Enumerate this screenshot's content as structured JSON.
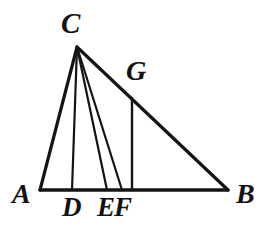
{
  "figure": {
    "stroke_color": "#141414",
    "background_color": "#ffffff",
    "label_color": "#121212"
  },
  "labels": {
    "A": "A",
    "B": "B",
    "C": "C",
    "D": "D",
    "E": "E",
    "F": "F",
    "G": "G"
  },
  "chart_data": {
    "type": "diagram",
    "points": [
      {
        "name": "A",
        "x": 40,
        "y": 190,
        "label_x": 12,
        "label_y": 180
      },
      {
        "name": "B",
        "x": 228,
        "y": 190,
        "label_x": 236,
        "label_y": 180
      },
      {
        "name": "C",
        "x": 77,
        "y": 47,
        "label_x": 61,
        "label_y": 9
      },
      {
        "name": "D",
        "x": 72,
        "y": 190,
        "label_x": 62,
        "label_y": 194
      },
      {
        "name": "E",
        "x": 107,
        "y": 190,
        "label_x": 97,
        "label_y": 194
      },
      {
        "name": "F",
        "x": 122,
        "y": 190,
        "label_x": 114,
        "label_y": 194
      },
      {
        "name": "G",
        "x": 132,
        "y": 100,
        "label_x": 126,
        "label_y": 57
      }
    ],
    "segments": [
      {
        "name": "AB",
        "from": "A",
        "to": "B",
        "kind": "triangle-side"
      },
      {
        "name": "AC",
        "from": "A",
        "to": "C",
        "kind": "triangle-side"
      },
      {
        "name": "CB",
        "from": "C",
        "to": "B",
        "kind": "triangle-side"
      },
      {
        "name": "CD",
        "from": "C",
        "to": "D",
        "kind": "cevian-vertical"
      },
      {
        "name": "CE",
        "from": "C",
        "to": "E",
        "kind": "cevian"
      },
      {
        "name": "CF",
        "from": "C",
        "to": "F",
        "kind": "cevian"
      },
      {
        "name": "GF",
        "from": "G",
        "to": "F",
        "kind": "vertical"
      }
    ]
  }
}
